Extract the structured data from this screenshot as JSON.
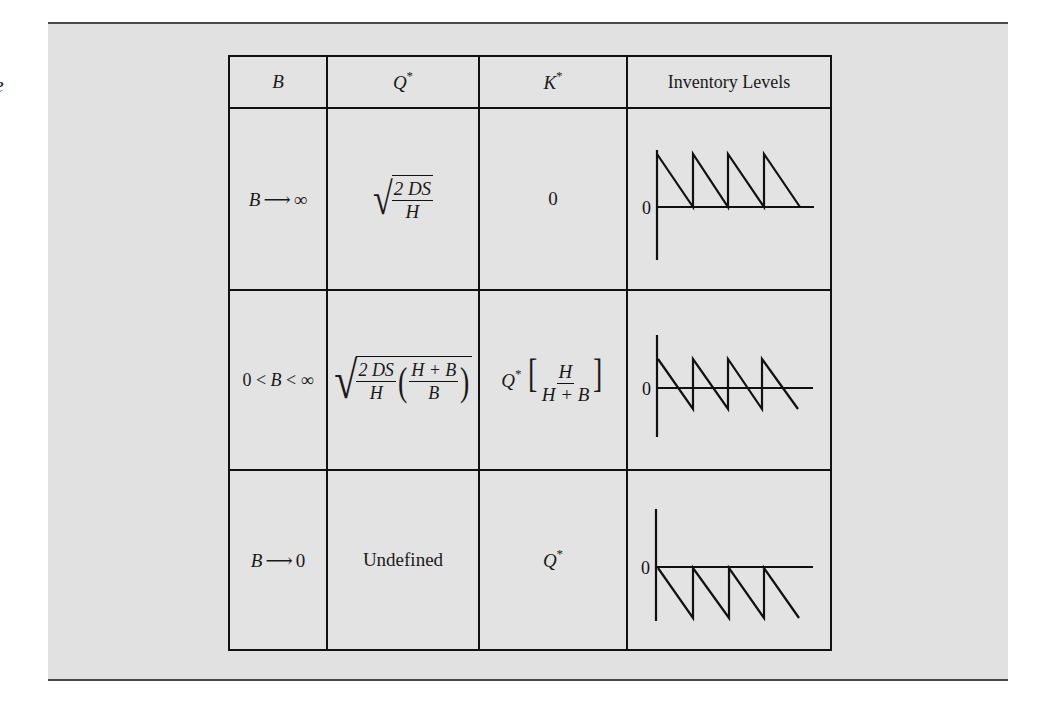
{
  "caption_fragment": "e",
  "table": {
    "headers": {
      "b": {
        "sym": "B"
      },
      "q": {
        "sym": "Q",
        "sup": "*"
      },
      "k": {
        "sym": "K",
        "sup": "*"
      },
      "levels": {
        "text": "Inventory Levels"
      }
    },
    "rows": [
      {
        "b": {
          "left": "B",
          "arrow": "⟶",
          "right": "∞"
        },
        "q": {
          "type": "sqrt_frac",
          "num": "2 DS",
          "den": "H"
        },
        "k": {
          "text": "0"
        },
        "levels": {
          "zero_label": "0",
          "case": "no-backorders"
        }
      },
      {
        "b": {
          "text_a": "0 <",
          "sym": "B",
          "text_b": "< ∞"
        },
        "q": {
          "type": "sqrt_frac_product",
          "num": "2 DS",
          "den": "H",
          "num2": "H + B",
          "den2": "B"
        },
        "k": {
          "q": "Q",
          "sup": "*",
          "num": "H",
          "den": "H + B"
        },
        "levels": {
          "zero_label": "0",
          "case": "partial-backorders"
        }
      },
      {
        "b": {
          "left": "B",
          "arrow": "⟶",
          "right": "0"
        },
        "q": {
          "text": "Undefined"
        },
        "k": {
          "q": "Q",
          "sup": "*"
        },
        "levels": {
          "zero_label": "0",
          "case": "all-backorders"
        }
      }
    ]
  },
  "plots": [
    {
      "axis_top": 148,
      "axis_bottom": 258,
      "zero_y": 205,
      "peak_y": 152,
      "trough_y": 205,
      "peaks_x": [
        654,
        690,
        725,
        761
      ],
      "end_x": 797,
      "line_end_x": 811
    },
    {
      "axis_top": 333,
      "axis_bottom": 435,
      "zero_y": 386,
      "peak_y": 357,
      "trough_y": 407,
      "peaks_x": [
        655,
        690,
        725,
        759
      ],
      "end_x": 795,
      "line_end_x": 810
    },
    {
      "axis_top": 507,
      "axis_bottom": 619,
      "zero_y": 565,
      "peak_y": 566,
      "trough_y": 616,
      "peaks_x": [
        655,
        690,
        726,
        761
      ],
      "end_x": 796,
      "line_end_x": 810
    }
  ],
  "colors": {
    "panel": "#e1e1e1",
    "rule": "#4a4a4a",
    "ink": "#111111"
  }
}
